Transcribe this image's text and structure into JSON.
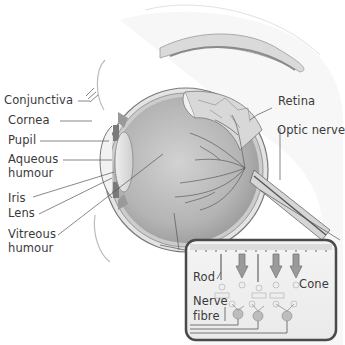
{
  "labels": {
    "conjunctiva": "Conjunctiva",
    "cornea": "Cornea",
    "pupil": "Pupil",
    "aqueous_humour_1": "Aqueous",
    "aqueous_humour_2": "humour",
    "iris": "Iris",
    "lens": "Lens",
    "vitreous_humour_1": "Vitreous",
    "vitreous_humour_2": "humour",
    "retina": "Retina",
    "optic_nerve": "Optic nerve"
  },
  "inset": {
    "rod": "Rod",
    "cone": "Cone",
    "nerve_fibre_1": "Nerve",
    "nerve_fibre_2": "fibre"
  },
  "colors": {
    "outline": "#6a6a6a",
    "eyeball_fill": "#b9b9b9",
    "sclera": "#e6e6e6",
    "vessels": "#555555",
    "inset_border": "#5a5a5a"
  }
}
